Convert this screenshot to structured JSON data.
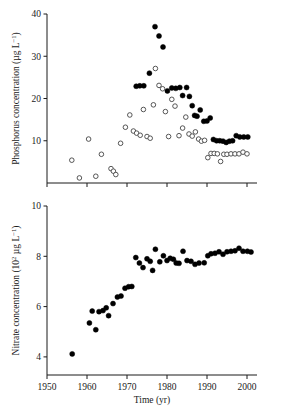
{
  "figure": {
    "background": "#ffffff",
    "ink": "#1a1a1a",
    "width": 286,
    "height": 420
  },
  "chart_data": [
    {
      "type": "scatter",
      "panel": "top",
      "title": "",
      "xlabel": "",
      "ylabel": "Phosphorus concentration (µg L−1)",
      "ylabel_main": "Phosphorus concentration (µg L",
      "ylabel_sup": "−1",
      "ylabel_tail": ")",
      "xlim": [
        1950,
        2002
      ],
      "ylim": [
        0,
        40
      ],
      "grid": false,
      "legend": "none",
      "xticks": [
        1950,
        1960,
        1970,
        1980,
        1990,
        2000
      ],
      "xticklabels": [
        "",
        "",
        "",
        "",
        "",
        ""
      ],
      "yticks": [
        10,
        20,
        30,
        40
      ],
      "yticklabels": [
        "10",
        "20",
        "30",
        "40"
      ],
      "series": [
        {
          "name": "Phosphorus filled",
          "marker": "filled-circle",
          "color": "#000000",
          "points": [
            [
              1972.3,
              22.9
            ],
            [
              1973.2,
              23.0
            ],
            [
              1974.2,
              23.0
            ],
            [
              1975.6,
              26.0
            ],
            [
              1977.0,
              37.0
            ],
            [
              1978.0,
              34.8
            ],
            [
              1979.0,
              32.2
            ],
            [
              1980.1,
              21.8
            ],
            [
              1981.2,
              22.5
            ],
            [
              1982.2,
              22.4
            ],
            [
              1983.2,
              22.6
            ],
            [
              1983.9,
              20.7
            ],
            [
              1984.9,
              22.6
            ],
            [
              1985.6,
              20.5
            ],
            [
              1986.3,
              18.3
            ],
            [
              1986.9,
              16.0
            ],
            [
              1987.5,
              15.8
            ],
            [
              1988.3,
              17.3
            ],
            [
              1989.2,
              14.6
            ],
            [
              1990.0,
              14.7
            ],
            [
              1990.8,
              15.4
            ],
            [
              1991.6,
              10.3
            ],
            [
              1992.4,
              10.0
            ],
            [
              1993.2,
              10.0
            ],
            [
              1994.0,
              9.9
            ],
            [
              1994.8,
              9.6
            ],
            [
              1995.6,
              9.9
            ],
            [
              1996.4,
              10.0
            ],
            [
              1997.3,
              11.2
            ],
            [
              1998.2,
              10.9
            ],
            [
              1999.2,
              10.9
            ],
            [
              2000.2,
              10.9
            ]
          ]
        },
        {
          "name": "Phosphorus open",
          "marker": "open-circle",
          "color": "#ffffff",
          "points": [
            [
              1956.2,
              5.4
            ],
            [
              1958.1,
              1.2
            ],
            [
              1960.4,
              10.4
            ],
            [
              1962.2,
              1.6
            ],
            [
              1963.6,
              6.8
            ],
            [
              1966.0,
              3.4
            ],
            [
              1966.6,
              2.8
            ],
            [
              1967.2,
              2.0
            ],
            [
              1968.4,
              9.4
            ],
            [
              1969.6,
              13.2
            ],
            [
              1970.7,
              16.1
            ],
            [
              1971.6,
              12.3
            ],
            [
              1972.4,
              11.8
            ],
            [
              1973.3,
              11.3
            ],
            [
              1974.1,
              17.4
            ],
            [
              1975.0,
              11.0
            ],
            [
              1975.8,
              10.6
            ],
            [
              1976.6,
              18.5
            ],
            [
              1977.1,
              27.1
            ],
            [
              1978.0,
              23.1
            ],
            [
              1978.9,
              22.3
            ],
            [
              1979.6,
              16.9
            ],
            [
              1980.4,
              11.0
            ],
            [
              1981.2,
              19.8
            ],
            [
              1982.0,
              18.2
            ],
            [
              1983.0,
              11.2
            ],
            [
              1983.9,
              13.0
            ],
            [
              1984.7,
              15.6
            ],
            [
              1985.5,
              11.6
            ],
            [
              1986.3,
              11.1
            ],
            [
              1987.1,
              12.1
            ],
            [
              1987.9,
              10.4
            ],
            [
              1988.6,
              9.9
            ],
            [
              1989.4,
              10.1
            ],
            [
              1990.2,
              6.0
            ],
            [
              1991.0,
              7.0
            ],
            [
              1991.8,
              7.0
            ],
            [
              1992.6,
              6.9
            ],
            [
              1993.4,
              5.1
            ],
            [
              1994.2,
              6.8
            ],
            [
              1995.0,
              6.8
            ],
            [
              1996.0,
              6.9
            ],
            [
              1997.0,
              6.9
            ],
            [
              1998.0,
              6.9
            ],
            [
              1999.0,
              7.3
            ],
            [
              2000.0,
              6.9
            ]
          ]
        }
      ]
    },
    {
      "type": "scatter",
      "panel": "bottom",
      "title": "",
      "xlabel": "Time (yr)",
      "ylabel": "Nitrate concentration (102 µg L−1)",
      "ylabel_lead": "Nitrate concentration (10",
      "ylabel_exp": "2",
      "ylabel_mid": " µg L",
      "ylabel_sup": "−1",
      "ylabel_tail": ")",
      "xlim": [
        1950,
        2002
      ],
      "ylim": [
        3.3,
        10
      ],
      "grid": false,
      "legend": "none",
      "xticks": [
        1950,
        1960,
        1970,
        1980,
        1990,
        2000
      ],
      "xticklabels": [
        "1950",
        "1960",
        "1970",
        "1980",
        "1990",
        "2000"
      ],
      "yticks": [
        4,
        6,
        8,
        10
      ],
      "yticklabels": [
        "4",
        "6",
        "8",
        "10"
      ],
      "series": [
        {
          "name": "Nitrate",
          "marker": "filled-circle",
          "color": "#000000",
          "points": [
            [
              1956.3,
              4.12
            ],
            [
              1960.6,
              5.35
            ],
            [
              1961.3,
              5.82
            ],
            [
              1962.2,
              5.08
            ],
            [
              1963.0,
              5.8
            ],
            [
              1964.0,
              5.84
            ],
            [
              1964.8,
              5.95
            ],
            [
              1965.4,
              5.64
            ],
            [
              1966.5,
              6.12
            ],
            [
              1967.6,
              6.38
            ],
            [
              1968.5,
              6.42
            ],
            [
              1969.5,
              6.73
            ],
            [
              1970.4,
              6.79
            ],
            [
              1971.2,
              6.8
            ],
            [
              1972.2,
              7.95
            ],
            [
              1973.1,
              7.73
            ],
            [
              1974.0,
              7.55
            ],
            [
              1975.0,
              7.9
            ],
            [
              1975.8,
              7.8
            ],
            [
              1976.4,
              7.44
            ],
            [
              1977.1,
              8.28
            ],
            [
              1978.2,
              7.78
            ],
            [
              1979.1,
              8.02
            ],
            [
              1980.0,
              7.83
            ],
            [
              1980.8,
              7.92
            ],
            [
              1981.6,
              7.88
            ],
            [
              1982.3,
              7.73
            ],
            [
              1983.0,
              7.72
            ],
            [
              1984.0,
              8.2
            ],
            [
              1985.0,
              7.83
            ],
            [
              1986.0,
              7.8
            ],
            [
              1987.0,
              7.68
            ],
            [
              1988.0,
              7.73
            ],
            [
              1989.3,
              7.74
            ],
            [
              1990.2,
              8.02
            ],
            [
              1991.0,
              8.1
            ],
            [
              1992.0,
              8.12
            ],
            [
              1993.0,
              8.18
            ],
            [
              1994.0,
              8.08
            ],
            [
              1995.0,
              8.18
            ],
            [
              1996.0,
              8.2
            ],
            [
              1997.0,
              8.22
            ],
            [
              1998.0,
              8.32
            ],
            [
              1999.0,
              8.2
            ],
            [
              2000.1,
              8.2
            ],
            [
              2001.0,
              8.17
            ]
          ]
        }
      ]
    }
  ]
}
